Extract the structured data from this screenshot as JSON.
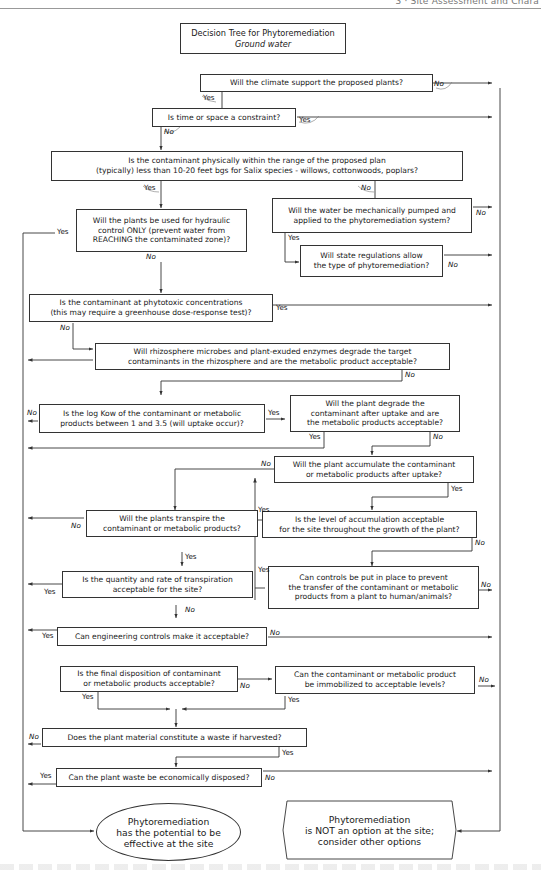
{
  "page": {
    "running_header": "3 · Site Assessment and Chara"
  },
  "diagram": {
    "title": "Decision Tree for Phytoremediation",
    "subtitle": "Ground water",
    "nodes": [
      {
        "id": "q_climate",
        "lines": [
          "Will the climate support the proposed plants?"
        ]
      },
      {
        "id": "q_time_space",
        "lines": [
          "Is time or space a constraint?"
        ]
      },
      {
        "id": "q_range",
        "lines": [
          "Is the contaminant physically within the range of the proposed plan",
          "(typically) less than 10-20 feet bgs for Salix species - willows, cottonwoods, poplars?"
        ]
      },
      {
        "id": "q_hydraulic",
        "lines": [
          "Will the plants be used for hydraulic",
          "control ONLY (prevent water from",
          "REACHING the contaminated zone)?"
        ]
      },
      {
        "id": "q_pumped",
        "lines": [
          "Will the water be mechanically pumped and",
          "applied to the phytoremediation system?"
        ]
      },
      {
        "id": "q_state_regs",
        "lines": [
          "Will state regulations allow",
          "the type of phytoremediation?"
        ]
      },
      {
        "id": "q_phytotoxic",
        "lines": [
          "Is the contaminant at phytotoxic concentrations",
          "(this may require a greenhouse dose-response test)?"
        ]
      },
      {
        "id": "q_rhizosphere",
        "lines": [
          "Will rhizosphere microbes and plant-exuded enzymes degrade the target",
          "contaminants in the rhizosphere and are the metabolic product acceptable?"
        ]
      },
      {
        "id": "q_logkow",
        "lines": [
          "Is the log Kow of the contaminant or metabolic",
          "products between 1 and 3.5 (will uptake occur)?"
        ]
      },
      {
        "id": "q_degrade",
        "lines": [
          "Will the plant degrade the",
          "contaminant after uptake and are",
          "the metabolic products acceptable?"
        ]
      },
      {
        "id": "q_accumulate",
        "lines": [
          "Will the plant accumulate the contaminant",
          "or metabolic products after uptake?"
        ]
      },
      {
        "id": "q_transpire",
        "lines": [
          "Will the plants transpire the",
          "contaminant or metabolic products?"
        ]
      },
      {
        "id": "q_accum_level",
        "lines": [
          "Is the level of accumulation acceptable",
          "for the site throughout the growth of the plant?"
        ]
      },
      {
        "id": "q_transpiration_rate",
        "lines": [
          "Is the quantity and rate of transpiration",
          "acceptable for the site?"
        ]
      },
      {
        "id": "q_controls",
        "lines": [
          "Can controls be put in place to prevent",
          "the transfer of the contaminant or metabolic",
          "products from a plant to human/animals?"
        ]
      },
      {
        "id": "q_engineering",
        "lines": [
          "Can engineering controls make it acceptable?"
        ]
      },
      {
        "id": "q_final_disposition",
        "lines": [
          "Is the final disposition of contaminant",
          "or metabolic products acceptable?"
        ]
      },
      {
        "id": "q_immobilized",
        "lines": [
          "Can the contaminant or metabolic product",
          "be immobilized to acceptable levels?"
        ]
      },
      {
        "id": "q_waste",
        "lines": [
          "Does the plant material constitute a waste if harvested?"
        ]
      },
      {
        "id": "q_disposed",
        "lines": [
          "Can the plant waste be economically disposed?"
        ]
      }
    ],
    "outcomes": {
      "effective": [
        "Phytoremediation",
        "has the potential to be",
        "effective at the site"
      ],
      "not_option": [
        "Phytoremediation",
        "is NOT an option at the site;",
        "consider other options"
      ]
    },
    "labels": {
      "yes": "Yes",
      "no": "No"
    },
    "colors": {
      "line": "#333333",
      "background": "#ffffff",
      "text": "#1a1a1a"
    }
  }
}
